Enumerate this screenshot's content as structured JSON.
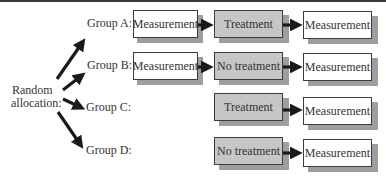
{
  "diagram": {
    "allocation_label": [
      "Random",
      "allocation:"
    ],
    "groups": [
      {
        "label": "Group A:",
        "steps": [
          {
            "text": "Measurement",
            "style": "white"
          },
          {
            "text": "Treatment",
            "style": "gray"
          },
          {
            "text": "Measurement",
            "style": "white"
          }
        ]
      },
      {
        "label": "Group B:",
        "steps": [
          {
            "text": "Measurement",
            "style": "white"
          },
          {
            "text": "No treatment",
            "style": "gray"
          },
          {
            "text": "Measurement",
            "style": "white"
          }
        ]
      },
      {
        "label": "Group C:",
        "steps": [
          {
            "text": "Treatment",
            "style": "gray"
          },
          {
            "text": "Measurement",
            "style": "white"
          }
        ]
      },
      {
        "label": "Group D:",
        "steps": [
          {
            "text": "No treatment",
            "style": "gray"
          },
          {
            "text": "Measurement",
            "style": "white"
          }
        ]
      }
    ],
    "colors": {
      "box_white": "#ffffff",
      "box_gray": "#c6c6c6",
      "shadow": "#9e9e9e",
      "arrow": "#1a1a1a",
      "border": "#3c3c3c"
    }
  }
}
